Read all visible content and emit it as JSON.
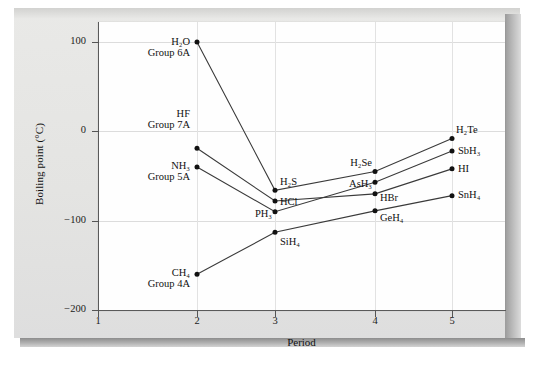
{
  "figure": {
    "axis_title_y": "Boiling point (°C)",
    "axis_title_x": "Period"
  },
  "chart_data": {
    "type": "line",
    "title": "",
    "xlabel": "Period",
    "ylabel": "Boiling point (°C)",
    "xlim": [
      1,
      5.35
    ],
    "ylim": [
      -200,
      130
    ],
    "xticks": [
      "1",
      "2",
      "3",
      "4",
      "5"
    ],
    "yticks": [
      "100",
      "0",
      "−100",
      "−200"
    ],
    "ytick_values": [
      100,
      0,
      -100,
      -200
    ],
    "grid": "horizontal gridlines at each y tick, faint vertical gridlines at each period",
    "legend": "none (series labelled inline at data points)",
    "x": [
      2,
      3,
      4,
      5
    ],
    "series": [
      {
        "name": "Group 6A",
        "group_label": "Group 6A",
        "first_label": "H₂O",
        "values": [
          100,
          -66,
          -45,
          -8
        ],
        "point_labels": [
          "H₂O",
          "H₂S",
          "H₂Se",
          "H₂Te"
        ]
      },
      {
        "name": "Group 7A",
        "group_label": "Group 7A",
        "first_label": "HF",
        "values": [
          -19,
          -78,
          -70,
          -42
        ],
        "point_labels": [
          "HF",
          "HCl",
          "HBr",
          "HI"
        ]
      },
      {
        "name": "Group 5A",
        "group_label": "Group 5A",
        "first_label": "NH₃",
        "values": [
          -40,
          -90,
          -57,
          -22
        ],
        "point_labels": [
          "NH₃",
          "PH₃",
          "AsH₃",
          "SbH₃"
        ]
      },
      {
        "name": "Group 4A",
        "group_label": "Group 4A",
        "first_label": "CH₄",
        "values": [
          -160,
          -113,
          -89,
          -72
        ],
        "point_labels": [
          "CH₄",
          "SiH₄",
          "GeH₄",
          "SnH₄"
        ]
      }
    ],
    "annotations": [
      {
        "id": "h2o",
        "text": "H₂O",
        "sub": "Group 6A",
        "period": 2,
        "value": 100
      },
      {
        "id": "hf",
        "text": "HF",
        "sub": "Group 7A",
        "period": 2,
        "value": -19
      },
      {
        "id": "nh3",
        "text": "NH₃",
        "sub": "Group 5A",
        "period": 2,
        "value": -40
      },
      {
        "id": "ch4",
        "text": "CH₄",
        "sub": "Group 4A",
        "period": 2,
        "value": -160
      },
      {
        "id": "h2s",
        "text": "H₂S",
        "sub": "",
        "period": 3,
        "value": -66
      },
      {
        "id": "hcl",
        "text": "HCl",
        "sub": "",
        "period": 3,
        "value": -78
      },
      {
        "id": "ph3",
        "text": "PH₃",
        "sub": "",
        "period": 3,
        "value": -90
      },
      {
        "id": "sih4",
        "text": "SiH₄",
        "sub": "",
        "period": 3,
        "value": -113
      },
      {
        "id": "h2se",
        "text": "H₂Se",
        "sub": "",
        "period": 4,
        "value": -45
      },
      {
        "id": "ash3",
        "text": "AsH₃",
        "sub": "",
        "period": 4,
        "value": -57
      },
      {
        "id": "hbr",
        "text": "HBr",
        "sub": "",
        "period": 4,
        "value": -70
      },
      {
        "id": "geh4",
        "text": "GeH₄",
        "sub": "",
        "period": 4,
        "value": -89
      },
      {
        "id": "h2te",
        "text": "H₂Te",
        "sub": "",
        "period": 5,
        "value": -8
      },
      {
        "id": "sbh3",
        "text": "SbH₃",
        "sub": "",
        "period": 5,
        "value": -22
      },
      {
        "id": "hi",
        "text": "HI",
        "sub": "",
        "period": 5,
        "value": -42
      },
      {
        "id": "snh4",
        "text": "SnH₄",
        "sub": "",
        "period": 5,
        "value": -72
      }
    ],
    "colors": {
      "line": "#3a3a3a",
      "marker": "#111111",
      "grid": "#dcdcdc",
      "axis": "#5a5a5a",
      "plot_background": "#fefefe",
      "page_background": "#e6e6e4"
    }
  },
  "ticks": {
    "y": [
      "100",
      "0",
      "−100",
      "−200"
    ],
    "x": [
      "1",
      "2",
      "3",
      "4",
      "5"
    ]
  }
}
